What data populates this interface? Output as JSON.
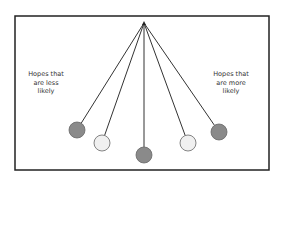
{
  "diagram": {
    "frame": {
      "x": 15,
      "y": 16,
      "width": 254,
      "height": 154,
      "stroke": "#222222"
    },
    "apex": {
      "x": 144,
      "y": 23
    },
    "bobs": [
      {
        "id": "far-left",
        "x": 77,
        "y": 130,
        "r": 8,
        "fill": "#8a8a8a"
      },
      {
        "id": "near-left",
        "x": 102,
        "y": 143,
        "r": 8,
        "fill": "#f0f0f0"
      },
      {
        "id": "center",
        "x": 144,
        "y": 155,
        "r": 8,
        "fill": "#8a8a8a"
      },
      {
        "id": "near-right",
        "x": 188,
        "y": 143,
        "r": 8,
        "fill": "#f0f0f0"
      },
      {
        "id": "far-right",
        "x": 219,
        "y": 132,
        "r": 8,
        "fill": "#8a8a8a"
      }
    ],
    "left_label": {
      "lines": [
        "Hopes that",
        "are less",
        "likely"
      ]
    },
    "right_label": {
      "lines": [
        "Hopes that",
        "are more",
        "likely"
      ]
    }
  }
}
